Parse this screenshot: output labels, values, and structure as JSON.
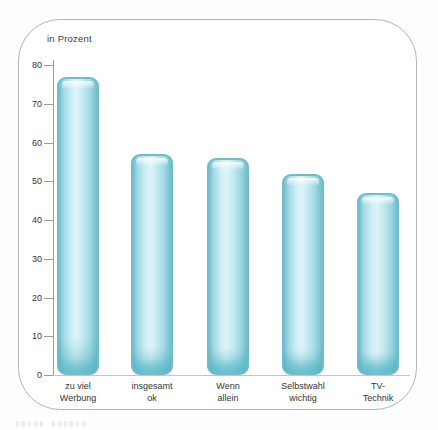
{
  "chart_data": {
    "type": "bar",
    "title": "in Prozent",
    "categories": [
      "zu viel\nWerbung",
      "insgesamt\nok",
      "Wenn\nallein",
      "Selbstwahl\nwichtig",
      "TV-\nTechnik"
    ],
    "values": [
      77,
      57,
      56,
      52,
      47
    ],
    "xlabel": "",
    "ylabel": "in Prozent",
    "ylim": [
      0,
      80
    ],
    "yticks": [
      0,
      10,
      20,
      30,
      40,
      50,
      60,
      70,
      80
    ],
    "grid": false,
    "legend": null,
    "bar_fill_color": "#b9e6ef",
    "bar_border_color": "#6fbcca",
    "axis_line_color": "#9c9c9c",
    "baseline_color": "#b7ccd1",
    "text_color": "#333333",
    "frame_border_color": "#b5b5b5"
  }
}
